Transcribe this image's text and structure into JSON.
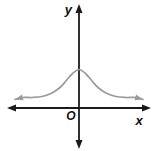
{
  "figure": {
    "colors": {
      "background": "#ffffff",
      "axis": "#1b1b1b",
      "curve": "#9b9b9b",
      "label": "#111111"
    }
  },
  "chart_data": {
    "type": "line",
    "title": "",
    "xlabel": "x",
    "ylabel": "y",
    "origin_label": "O",
    "grid": false,
    "axis_ticks": "none",
    "legend": "none",
    "axes_px": {
      "origin": [
        79,
        108
      ],
      "x_axis_y": 108,
      "y_axis_x": 79,
      "x_tip_left": [
        7,
        108
      ],
      "x_tip_right": [
        151,
        108
      ],
      "y_tip_top": [
        79,
        4
      ],
      "y_tip_bottom": [
        79,
        149
      ]
    },
    "series": [
      {
        "name": "bell curve",
        "color": "#9b9b9b",
        "end_arrows": true,
        "peak_px": [
          79,
          69.5
        ],
        "points_px": [
          [
            15,
            99.5
          ],
          [
            22,
            97.5
          ],
          [
            32,
            97.5
          ],
          [
            42,
            96.5
          ],
          [
            52,
            93
          ],
          [
            60,
            87.5
          ],
          [
            66,
            81
          ],
          [
            72,
            74
          ],
          [
            79,
            69.5
          ],
          [
            86,
            74
          ],
          [
            92,
            81
          ],
          [
            98,
            87.5
          ],
          [
            106,
            93
          ],
          [
            116,
            96.5
          ],
          [
            126,
            97.5
          ],
          [
            136,
            97.5
          ],
          [
            143,
            99.5
          ]
        ]
      }
    ]
  }
}
